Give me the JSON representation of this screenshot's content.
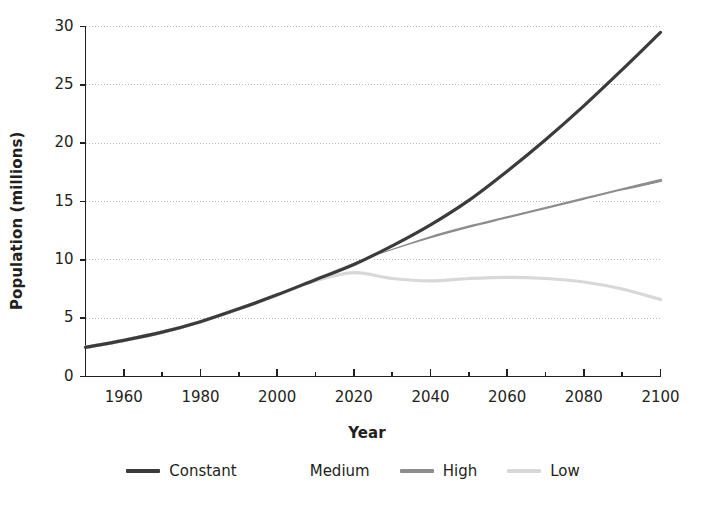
{
  "chart_data": {
    "type": "line",
    "title": "",
    "xlabel": "Year",
    "ylabel": "Population (millions)",
    "xlim": [
      1950,
      2100
    ],
    "ylim": [
      0,
      30
    ],
    "grid": true,
    "grid_axis": "y",
    "grid_style": "dotted",
    "legend_position": "bottom",
    "x_major_ticks": [
      1960,
      1980,
      2000,
      2020,
      2040,
      2060,
      2080,
      2100
    ],
    "x_minor_ticks": [
      1950,
      1970,
      1990,
      2010,
      2030,
      2050,
      2070,
      2090
    ],
    "x_tick_labels": [
      "1960",
      "1980",
      "2000",
      "2020",
      "2040",
      "2060",
      "2080",
      "2100"
    ],
    "y_ticks": [
      0,
      5,
      10,
      15,
      20,
      25,
      30
    ],
    "y_tick_labels": [
      "0",
      "5",
      "10",
      "15",
      "20",
      "25",
      "30"
    ],
    "x": [
      1950,
      1960,
      1970,
      1980,
      1990,
      2000,
      2010,
      2020,
      2030,
      2040,
      2050,
      2060,
      2070,
      2080,
      2090,
      2100
    ],
    "series": [
      {
        "name": "Constant",
        "color": "#3b3b3b",
        "width": 3.2,
        "values": [
          2.5,
          3.1,
          3.8,
          4.7,
          5.8,
          7.0,
          8.3,
          9.6,
          11.2,
          13.0,
          15.1,
          17.6,
          20.3,
          23.2,
          26.3,
          29.5
        ]
      },
      {
        "name": "Medium",
        "color": "#ffffff",
        "width": 3.2,
        "values": [
          2.5,
          3.1,
          3.8,
          4.7,
          5.8,
          7.0,
          8.3,
          9.6,
          10.7,
          11.7,
          12.6,
          13.4,
          14.2,
          15.0,
          15.8,
          16.5
        ]
      },
      {
        "name": "High",
        "color": "#8d8d8d",
        "width": 3.2,
        "values": [
          2.5,
          3.1,
          3.8,
          4.7,
          5.8,
          7.0,
          8.3,
          9.6,
          10.8,
          11.9,
          12.8,
          13.6,
          14.4,
          15.2,
          16.0,
          16.8
        ]
      },
      {
        "name": "Low",
        "color": "#d8d8d8",
        "width": 3.2,
        "values": [
          2.5,
          3.1,
          3.8,
          4.7,
          5.8,
          7.0,
          8.2,
          8.9,
          8.4,
          8.2,
          8.4,
          8.5,
          8.4,
          8.1,
          7.5,
          6.6
        ]
      }
    ]
  },
  "legend": {
    "items": [
      {
        "label": "Constant",
        "color": "#3b3b3b"
      },
      {
        "label": "Medium",
        "color": "#ffffff"
      },
      {
        "label": "High",
        "color": "#8d8d8d"
      },
      {
        "label": "Low",
        "color": "#d8d8d8"
      }
    ]
  },
  "axes": {
    "x_title": "Year",
    "y_title": "Population (millions)",
    "axis_color": "#231f20",
    "grid_color": "#b9b9b9"
  }
}
